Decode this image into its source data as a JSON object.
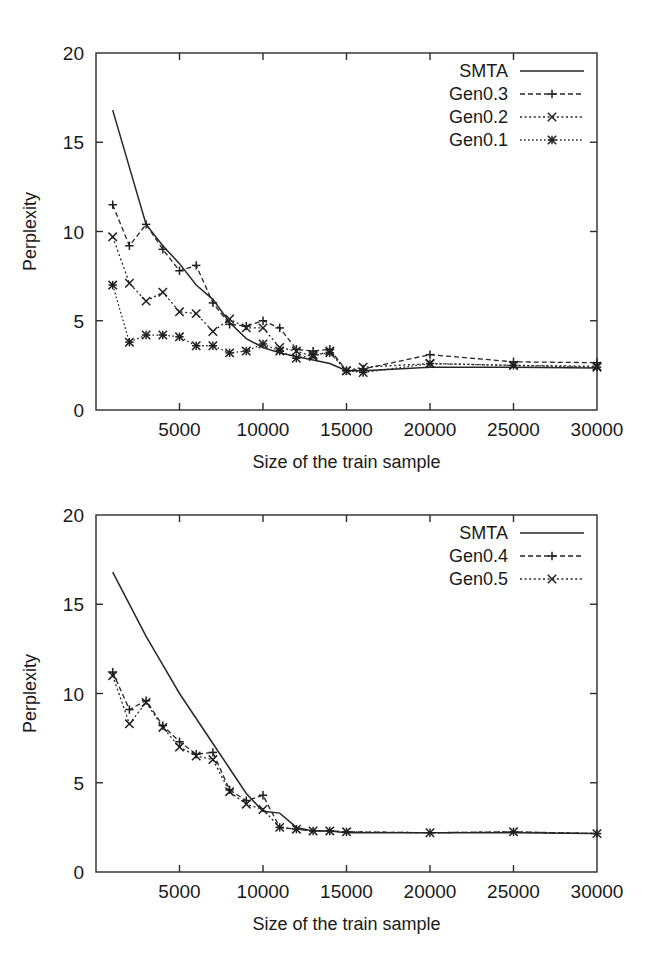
{
  "figure": {
    "panels": [
      {
        "id": "top",
        "y_label": "Perplexity",
        "x_label": "Size of the train sample"
      },
      {
        "id": "bottom",
        "y_label": "Perplexity",
        "x_label": "Size of the train sample"
      }
    ]
  },
  "chart_data": [
    {
      "type": "line",
      "panel": "top",
      "title": "",
      "xlabel": "Size of the train sample",
      "ylabel": "Perplexity",
      "xlim": [
        0,
        30000
      ],
      "ylim": [
        0,
        20
      ],
      "xticks": [
        0,
        5000,
        10000,
        15000,
        20000,
        25000,
        30000
      ],
      "xtick_labels": [
        "",
        "5000",
        "10000",
        "15000",
        "20000",
        "25000",
        "30000"
      ],
      "yticks": [
        0,
        5,
        10,
        15,
        20
      ],
      "ytick_labels": [
        "0",
        "5",
        "10",
        "15",
        "20"
      ],
      "grid": false,
      "legend_position": "upper right",
      "series": [
        {
          "name": "SMTA",
          "style": "solid",
          "marker": "none",
          "x": [
            1000,
            3000,
            4000,
            5000,
            6000,
            7000,
            8000,
            9000,
            10000,
            11000,
            12000,
            13000,
            14000,
            15000,
            16000,
            20000,
            25000,
            30000
          ],
          "values": [
            16.8,
            10.4,
            9.2,
            8.2,
            7.0,
            6.2,
            4.9,
            4.0,
            3.5,
            3.2,
            3.0,
            2.8,
            2.6,
            2.2,
            2.2,
            2.4,
            2.4,
            2.35
          ]
        },
        {
          "name": "Gen0.3",
          "style": "dashed",
          "marker": "plus",
          "x": [
            1000,
            2000,
            3000,
            4000,
            5000,
            6000,
            7000,
            8000,
            9000,
            10000,
            11000,
            12000,
            13000,
            14000,
            15000,
            16000,
            20000,
            25000,
            30000
          ],
          "values": [
            11.5,
            9.2,
            10.4,
            9.0,
            7.8,
            8.1,
            6.0,
            4.8,
            4.7,
            5.0,
            4.6,
            3.4,
            3.3,
            3.4,
            2.2,
            2.3,
            3.1,
            2.7,
            2.65
          ]
        },
        {
          "name": "Gen0.2",
          "style": "dotted",
          "marker": "cross",
          "x": [
            1000,
            2000,
            3000,
            4000,
            5000,
            6000,
            7000,
            8000,
            9000,
            10000,
            11000,
            12000,
            13000,
            14000,
            15000,
            16000,
            20000,
            25000,
            30000
          ],
          "values": [
            9.7,
            7.1,
            6.1,
            6.6,
            5.5,
            5.4,
            4.4,
            5.1,
            4.6,
            4.6,
            3.5,
            3.3,
            3.0,
            3.3,
            2.2,
            2.4,
            2.6,
            2.5,
            2.45
          ]
        },
        {
          "name": "Gen0.1",
          "style": "dotted2",
          "marker": "star",
          "x": [
            1000,
            2000,
            3000,
            4000,
            5000,
            6000,
            7000,
            8000,
            9000,
            10000,
            11000,
            12000,
            13000,
            14000,
            15000,
            16000,
            20000,
            25000,
            30000
          ],
          "values": [
            7.0,
            3.8,
            4.2,
            4.2,
            4.1,
            3.6,
            3.6,
            3.2,
            3.3,
            3.7,
            3.3,
            2.9,
            3.1,
            3.2,
            2.2,
            2.1,
            2.6,
            2.5,
            2.4
          ]
        }
      ]
    },
    {
      "type": "line",
      "panel": "bottom",
      "title": "",
      "xlabel": "Size of the train sample",
      "ylabel": "Perplexity",
      "xlim": [
        0,
        30000
      ],
      "ylim": [
        0,
        20
      ],
      "xticks": [
        0,
        5000,
        10000,
        15000,
        20000,
        25000,
        30000
      ],
      "xtick_labels": [
        "",
        "5000",
        "10000",
        "15000",
        "20000",
        "25000",
        "30000"
      ],
      "yticks": [
        0,
        5,
        10,
        15,
        20
      ],
      "ytick_labels": [
        "0",
        "5",
        "10",
        "15",
        "20"
      ],
      "grid": false,
      "legend_position": "upper right",
      "series": [
        {
          "name": "SMTA",
          "style": "solid",
          "marker": "none",
          "x": [
            1000,
            3000,
            4000,
            5000,
            6000,
            7000,
            8000,
            9000,
            10000,
            11000,
            12000,
            13000,
            14000,
            15000,
            20000,
            25000,
            30000
          ],
          "values": [
            16.8,
            13.2,
            11.6,
            10.0,
            8.6,
            7.2,
            5.8,
            4.4,
            3.4,
            3.3,
            2.5,
            2.3,
            2.3,
            2.2,
            2.2,
            2.2,
            2.15
          ]
        },
        {
          "name": "Gen0.4",
          "style": "dashed",
          "marker": "plus",
          "x": [
            1000,
            2000,
            3000,
            4000,
            5000,
            6000,
            7000,
            8000,
            9000,
            10000,
            11000,
            12000,
            13000,
            14000,
            15000,
            20000,
            25000,
            30000
          ],
          "values": [
            11.2,
            9.1,
            9.6,
            8.2,
            7.3,
            6.6,
            6.7,
            4.6,
            4.0,
            4.3,
            2.5,
            2.4,
            2.3,
            2.3,
            2.25,
            2.2,
            2.25,
            2.15
          ]
        },
        {
          "name": "Gen0.5",
          "style": "dotted",
          "marker": "cross",
          "x": [
            1000,
            2000,
            3000,
            4000,
            5000,
            6000,
            7000,
            8000,
            9000,
            10000,
            11000,
            12000,
            13000,
            14000,
            15000,
            20000,
            25000,
            30000
          ],
          "values": [
            11.0,
            8.3,
            9.5,
            8.1,
            7.0,
            6.5,
            6.3,
            4.5,
            3.8,
            3.5,
            2.5,
            2.4,
            2.3,
            2.3,
            2.25,
            2.2,
            2.25,
            2.15
          ]
        }
      ]
    }
  ]
}
